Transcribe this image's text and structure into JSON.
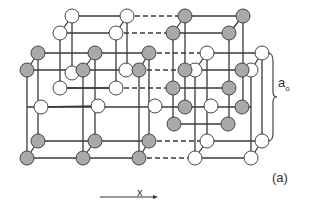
{
  "figure": {
    "label": "(a)",
    "lattice_constant_label": "a",
    "lattice_constant_subscript": "o",
    "axis_label": "x",
    "colors": {
      "gray_atom_fill": "#a9a9a9",
      "white_atom_fill": "#ffffff",
      "atom_stroke": "#444444",
      "line": "#3a3a3a",
      "thin_line": "#777777"
    }
  },
  "diagram": {
    "atom_radius": 7,
    "white_atoms": [
      [
        72,
        16
      ],
      [
        127,
        16
      ],
      [
        60,
        33
      ],
      [
        116,
        33
      ],
      [
        207,
        53
      ],
      [
        262,
        53
      ],
      [
        195,
        70
      ],
      [
        251,
        70
      ],
      [
        72,
        73
      ],
      [
        126,
        70
      ],
      [
        60,
        88
      ],
      [
        116,
        88
      ],
      [
        41,
        107
      ],
      [
        98,
        106
      ],
      [
        155,
        106
      ],
      [
        211,
        106
      ],
      [
        207,
        141
      ],
      [
        262,
        141
      ],
      [
        195,
        158
      ],
      [
        251,
        158
      ]
    ],
    "gray_atoms": [
      [
        185,
        16
      ],
      [
        243,
        16
      ],
      [
        173,
        33
      ],
      [
        229,
        33
      ],
      [
        38,
        53
      ],
      [
        95,
        53
      ],
      [
        149,
        53
      ],
      [
        27,
        70
      ],
      [
        83,
        70
      ],
      [
        139,
        70
      ],
      [
        185,
        70
      ],
      [
        242,
        70
      ],
      [
        173,
        88
      ],
      [
        229,
        88
      ],
      [
        38,
        141
      ],
      [
        95,
        141
      ],
      [
        149,
        141
      ],
      [
        27,
        158
      ],
      [
        83,
        158
      ],
      [
        139,
        158
      ],
      [
        185,
        107
      ],
      [
        242,
        107
      ],
      [
        174,
        124
      ],
      [
        228,
        124
      ]
    ],
    "lines_solid": [
      [
        72,
        16,
        127,
        16
      ],
      [
        60,
        33,
        116,
        33
      ],
      [
        72,
        16,
        60,
        33
      ],
      [
        127,
        16,
        116,
        33
      ],
      [
        185,
        16,
        243,
        16
      ],
      [
        173,
        33,
        229,
        33
      ],
      [
        185,
        16,
        173,
        33
      ],
      [
        243,
        16,
        229,
        33
      ],
      [
        38,
        53,
        149,
        53
      ],
      [
        27,
        70,
        139,
        70
      ],
      [
        38,
        53,
        27,
        70
      ],
      [
        95,
        53,
        83,
        70
      ],
      [
        149,
        53,
        139,
        70
      ],
      [
        207,
        53,
        262,
        53
      ],
      [
        195,
        70,
        251,
        70
      ],
      [
        207,
        53,
        195,
        70
      ],
      [
        262,
        53,
        251,
        70
      ],
      [
        38,
        141,
        149,
        141
      ],
      [
        27,
        158,
        139,
        158
      ],
      [
        38,
        141,
        27,
        158
      ],
      [
        95,
        141,
        83,
        158
      ],
      [
        149,
        141,
        139,
        158
      ],
      [
        207,
        141,
        262,
        141
      ],
      [
        195,
        158,
        251,
        158
      ],
      [
        207,
        141,
        195,
        158
      ],
      [
        262,
        141,
        251,
        158
      ],
      [
        60,
        88,
        116,
        88
      ],
      [
        173,
        88,
        229,
        88
      ],
      [
        41,
        107,
        98,
        106
      ],
      [
        174,
        124,
        228,
        124
      ],
      [
        27,
        70,
        27,
        158
      ],
      [
        83,
        70,
        83,
        158
      ],
      [
        139,
        70,
        139,
        158
      ],
      [
        38,
        53,
        38,
        141
      ],
      [
        95,
        53,
        95,
        141
      ],
      [
        149,
        53,
        149,
        141
      ],
      [
        60,
        33,
        60,
        88
      ],
      [
        116,
        33,
        116,
        88
      ],
      [
        72,
        16,
        72,
        73
      ],
      [
        127,
        16,
        127,
        70
      ],
      [
        173,
        33,
        173,
        124
      ],
      [
        229,
        33,
        229,
        124
      ],
      [
        185,
        16,
        185,
        107
      ],
      [
        243,
        16,
        243,
        107
      ],
      [
        195,
        70,
        195,
        158
      ],
      [
        251,
        70,
        251,
        158
      ],
      [
        207,
        53,
        207,
        141
      ],
      [
        262,
        53,
        262,
        141
      ],
      [
        27,
        107,
        251,
        107
      ],
      [
        60,
        88,
        116,
        88
      ]
    ],
    "lines_dashed": [
      [
        127,
        16,
        185,
        16
      ],
      [
        116,
        33,
        173,
        33
      ],
      [
        149,
        53,
        207,
        53
      ],
      [
        139,
        70,
        195,
        70
      ],
      [
        116,
        88,
        173,
        88
      ],
      [
        149,
        141,
        207,
        141
      ],
      [
        139,
        158,
        195,
        158
      ]
    ],
    "brace": {
      "x": 268,
      "y1": 53,
      "y2": 141
    },
    "arrow": {
      "x1": 100,
      "y1": 197,
      "x2": 158,
      "y2": 197
    }
  }
}
